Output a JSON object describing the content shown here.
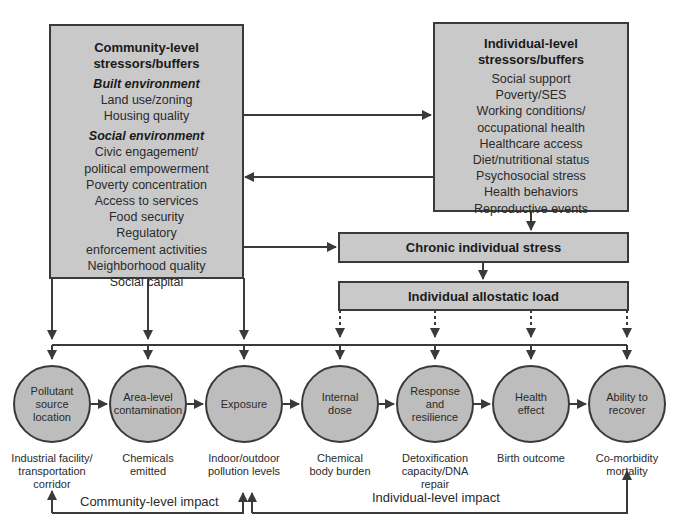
{
  "community_box": {
    "title_line1": "Community-level",
    "title_line2": "stressors/buffers",
    "built_heading": "Built environment",
    "built_items": [
      "Land use/zoning",
      "Housing quality"
    ],
    "social_heading": "Social environment",
    "social_items": [
      "Civic engagement/",
      "political empowerment",
      "Poverty concentration",
      "Access to services",
      "Food security",
      "Regulatory",
      "enforcement activities",
      "Neighborhood quality",
      "Social capital"
    ]
  },
  "individual_box": {
    "title_line1": "Individual-level",
    "title_line2": "stressors/buffers",
    "items": [
      "Social support",
      "Poverty/SES",
      "Working conditions/",
      "occupational health",
      "Healthcare access",
      "Diet/nutritional status",
      "Psychosocial stress",
      "Health behaviors",
      "Reproductive events"
    ]
  },
  "chronic_stress": {
    "label": "Chronic individual stress"
  },
  "allostatic_load": {
    "label": "Individual allostatic load"
  },
  "stages": [
    {
      "label": [
        "Pollutant",
        "source",
        "location"
      ],
      "caption": [
        "Industrial facility/",
        "transportation",
        "corridor"
      ]
    },
    {
      "label": [
        "Area-level",
        "contamination"
      ],
      "caption": [
        "Chemicals",
        "emitted"
      ]
    },
    {
      "label": [
        "Exposure"
      ],
      "caption": [
        "Indoor/outdoor",
        "pollution levels"
      ]
    },
    {
      "label": [
        "Internal",
        "dose"
      ],
      "caption": [
        "Chemical",
        "body burden"
      ]
    },
    {
      "label": [
        "Response",
        "and",
        "resilience"
      ],
      "caption": [
        "Detoxification",
        "capacity/DNA",
        "repair"
      ]
    },
    {
      "label": [
        "Health",
        "effect"
      ],
      "caption": [
        "Birth outcome"
      ]
    },
    {
      "label": [
        "Ability to",
        "recover"
      ],
      "caption": [
        "Co-morbidity",
        "mortality"
      ]
    }
  ],
  "feedback": {
    "community_impact": "Community-level impact",
    "individual_impact": "Individual-level impact"
  },
  "colors": {
    "fill": "#c9c9c9",
    "circle_fill": "#bdbdbd",
    "stroke": "#3a3a3a"
  }
}
